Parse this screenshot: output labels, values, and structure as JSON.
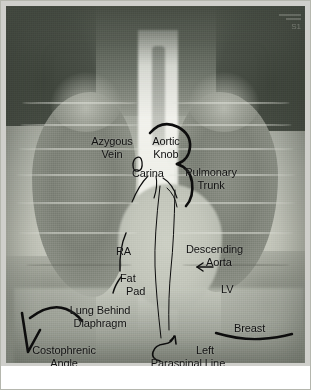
{
  "figure": {
    "caption": "",
    "corner_stamp": "S1"
  },
  "image": {
    "modality": "chest-xray",
    "view": "PA",
    "colors": {
      "ink": "#111111",
      "background_dark": "#545a50",
      "lung_field": "#8a8e84",
      "mediastinum_bright": "#f5f6f0",
      "frame": "#b5b7ae"
    }
  },
  "labels": [
    {
      "id": "azygous-vein",
      "text_line1": "Azygous",
      "text_line2": "Vein"
    },
    {
      "id": "aortic-knob",
      "text_line1": "Aortic",
      "text_line2": "Knob"
    },
    {
      "id": "carina",
      "text_line1": "Carina",
      "text_line2": ""
    },
    {
      "id": "pulmonary-trunk",
      "text_line1": "Pulmonary",
      "text_line2": "Trunk"
    },
    {
      "id": "right-atrium",
      "text_line1": "RA",
      "text_line2": ""
    },
    {
      "id": "descending-aorta",
      "text_line1": "Descending",
      "text_line2": "Aorta"
    },
    {
      "id": "fat-pad",
      "text_line1": "Fat",
      "text_line2": "Pad"
    },
    {
      "id": "left-ventricle",
      "text_line1": "LV",
      "text_line2": ""
    },
    {
      "id": "lung-behind-diaphragm",
      "text_line1": "Lung Behind",
      "text_line2": "Diaphragm"
    },
    {
      "id": "breast",
      "text_line1": "Breast",
      "text_line2": ""
    },
    {
      "id": "costophrenic-angle",
      "text_line1": "Costophrenic",
      "text_line2": "Angle"
    },
    {
      "id": "left-paraspinal-line",
      "text_line1": "Left",
      "text_line2": "Paraspinal Line"
    }
  ],
  "annotations": {
    "azygous_vein_oval": "small oval outline",
    "aortic_knob_arc": "thick arc over aortic knob",
    "pulmonary_trunk_arc": "thick arc over pulmonary trunk",
    "carina_branches": "two thin branching lines",
    "right_atrium_border": "thin curved stroke",
    "fat_pad_stroke": "short thin stroke",
    "descending_aorta_arrow": "left-pointing arrow",
    "paraspinal_lines": "two thin vertical lines",
    "paraspinal_arrow": "curved hook arrow",
    "diaphragm_curve": "thick curved stroke",
    "costophrenic_v": "thick V marker",
    "breast_curve": "long shallow curve"
  }
}
